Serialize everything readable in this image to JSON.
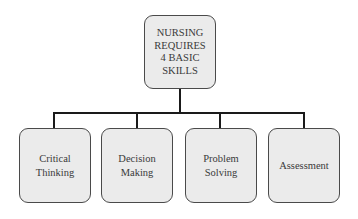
{
  "diagram": {
    "root": {
      "label": "NURSING\nREQUIRES\n4 BASIC\nSKILLS"
    },
    "children": [
      {
        "label": "Critical\nThinking"
      },
      {
        "label": "Decision\nMaking"
      },
      {
        "label": "Problem\nSolving"
      },
      {
        "label": "Assessment"
      }
    ],
    "colors": {
      "box_fill": "#ebebeb",
      "box_border": "#4a4a4a",
      "connector": "#1a1a1a"
    }
  }
}
